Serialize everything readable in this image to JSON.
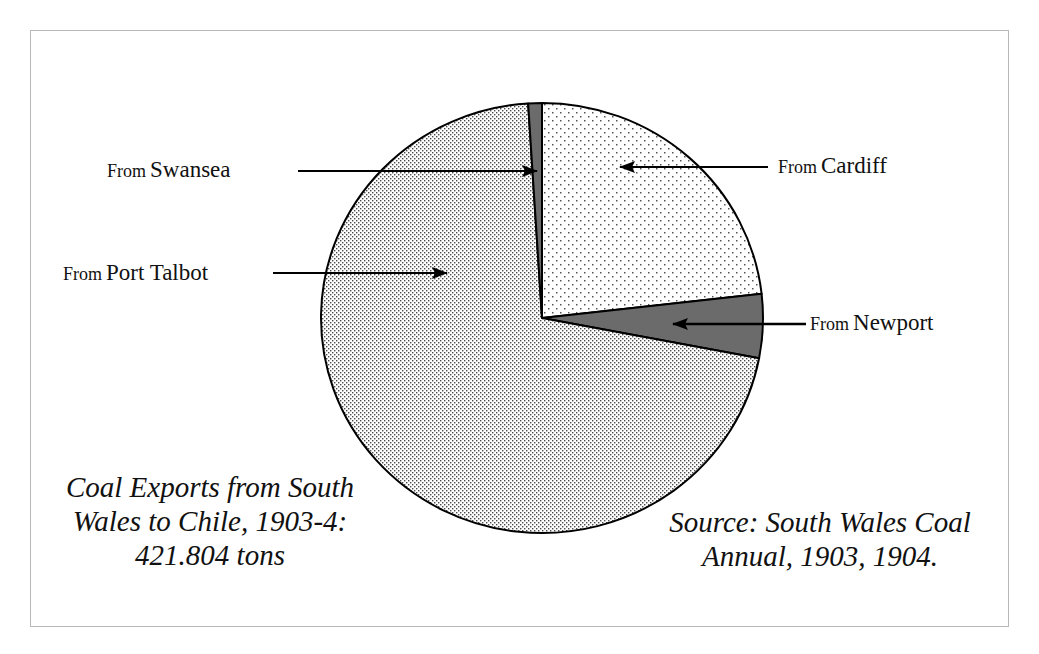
{
  "chart_data": {
    "type": "pie",
    "title": "Coal Exports from South Wales to Chile, 1903-4: 421.804 tons",
    "total_label": "421.804 tons",
    "total_tons": 421804,
    "units": "share of total tonnage (estimated from slice angles)",
    "start_angle_deg": 0,
    "direction": "clockwise",
    "slices": [
      {
        "name": "From Cardiff",
        "place": "Cardiff",
        "percent": 23.2,
        "fill": "sparse-dots",
        "color": "#f2f2f2"
      },
      {
        "name": "From Newport",
        "place": "Newport",
        "percent": 4.8,
        "fill": "dark-gray",
        "color": "#6b6b6b"
      },
      {
        "name": "From Port Talbot",
        "place": "Port Talbot",
        "percent": 71.0,
        "fill": "dense-dots",
        "color": "#d9d9d9"
      },
      {
        "name": "From Swansea",
        "place": "Swansea",
        "percent": 1.0,
        "fill": "dark-gray",
        "color": "#6b6b6b"
      }
    ],
    "legend": "none (callout labels with arrows)",
    "source": "Source: South Wales Coal Annual, 1903, 1904."
  },
  "labels": {
    "from_word": "From",
    "cardiff": "Cardiff",
    "newport": "Newport",
    "port_talbot": "Port Talbot",
    "swansea": "Swansea"
  },
  "caption": {
    "line1": "Coal Exports from South",
    "line2": "Wales to Chile, 1903-4:",
    "line3": "421.804 tons"
  },
  "source": {
    "line1": "Source: South Wales Coal",
    "line2": "Annual, 1903, 1904."
  }
}
